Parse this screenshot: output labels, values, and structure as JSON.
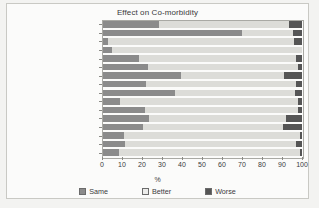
{
  "chart_data": {
    "type": "bar",
    "orientation": "horizontal",
    "stacked": true,
    "title": "Effect on Co-morbidity",
    "xlabel": "%",
    "ylabel": "",
    "xlim": [
      0,
      100
    ],
    "xticks": [
      0,
      10,
      20,
      30,
      40,
      50,
      60,
      70,
      80,
      90,
      100
    ],
    "grid": false,
    "legend_position": "bottom",
    "categories": [
      "Tremors",
      "Infertility",
      "Angina",
      "Diabetes",
      "Hirsutism",
      "Asthma",
      "Irreg periods",
      "Hypertension",
      "Headache",
      "Heartburn",
      "Incontinece",
      "Arthritis",
      "Depression",
      "Poor sleep/snoring",
      "Poor exercise tolerance",
      "Poor self esteem"
    ],
    "series": [
      {
        "name": "Same",
        "color": "#8b8b8b",
        "values": [
          28.5,
          70,
          3,
          5,
          18.5,
          23,
          39.5,
          22,
          36.5,
          9,
          21.5,
          23.5,
          20.5,
          11,
          11.5,
          8.5
        ]
      },
      {
        "name": "Better",
        "color": "#dcdcd8",
        "values": [
          65,
          25.5,
          93,
          95,
          78.5,
          75,
          51.5,
          75,
          60,
          89,
          76.5,
          68.5,
          70,
          88,
          85.5,
          90.5
        ]
      },
      {
        "name": "Worse",
        "color": "#555555",
        "values": [
          6.5,
          4.5,
          4,
          0,
          3,
          2,
          9,
          3,
          3.5,
          2,
          2,
          8,
          9.5,
          1,
          3,
          1
        ]
      }
    ]
  },
  "legend": {
    "items": [
      {
        "label": "Same"
      },
      {
        "label": "Better"
      },
      {
        "label": "Worse"
      }
    ]
  }
}
